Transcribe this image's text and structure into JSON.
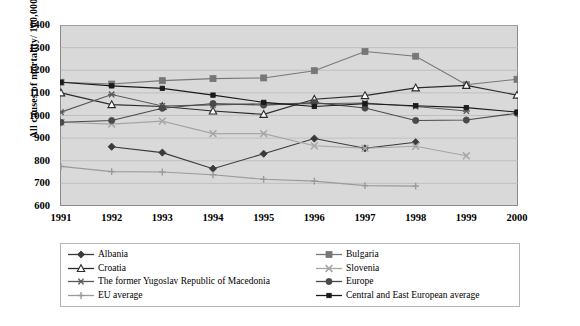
{
  "chart_data": {
    "type": "line",
    "title": "",
    "xlabel": "",
    "ylabel": "All causes of mortality/ 100,000",
    "x": [
      1991,
      1992,
      1993,
      1994,
      1995,
      1996,
      1997,
      1998,
      1999,
      2000
    ],
    "xticklabels": [
      "1991",
      "1992",
      "1993",
      "1994",
      "1995",
      "1996",
      "1997",
      "1998",
      "1999",
      "2000"
    ],
    "yticks": [
      600,
      700,
      800,
      900,
      1000,
      1100,
      1200,
      1300,
      1400
    ],
    "ylim": [
      600,
      1400
    ],
    "xlim": [
      1991,
      2000
    ],
    "grid": true,
    "grid_axis": "y",
    "plot_background": "#d9d9d9",
    "legend_position": "bottom",
    "series": [
      {
        "name": "Albania",
        "marker": "diamond",
        "color": "#3a3a3a",
        "x": [
          1992,
          1993,
          1994,
          1995,
          1996,
          1997,
          1998,
          1999
        ],
        "values": [
          862,
          836,
          765,
          831,
          898,
          855,
          882,
          null
        ]
      },
      {
        "name": "Bulgaria",
        "marker": "square",
        "color": "#777777",
        "x": [
          1991,
          1992,
          1993,
          1994,
          1995,
          1996,
          1997,
          1998,
          1999,
          2000
        ],
        "values": [
          1147,
          1139,
          1154,
          1163,
          1166,
          1198,
          1283,
          1262,
          1136,
          1160
        ]
      },
      {
        "name": "Croatia",
        "marker": "triangle-open",
        "color": "#2b2b2b",
        "x": [
          1991,
          1992,
          1993,
          1994,
          1995,
          1996,
          1997,
          1998,
          1999,
          2000
        ],
        "values": [
          1100,
          1048,
          1040,
          1020,
          1005,
          1072,
          1088,
          1122,
          1133,
          1090
        ]
      },
      {
        "name": "Slovenia",
        "marker": "x",
        "color": "#a6a6a6",
        "x": [
          1991,
          1992,
          1993,
          1994,
          1995,
          1996,
          1997,
          1998,
          1999,
          2000
        ],
        "values": [
          970,
          962,
          975,
          920,
          920,
          866,
          855,
          864,
          822,
          null
        ]
      },
      {
        "name": "The former Yugoslav Republic of Macedonia",
        "marker": "asterisk",
        "color": "#5a5a5a",
        "x": [
          1991,
          1992,
          1993,
          1994,
          1995,
          1996,
          1997,
          1998,
          1999,
          2000
        ],
        "values": [
          1015,
          1093,
          1042,
          1047,
          1052,
          1052,
          1055,
          1040,
          1020,
          null
        ]
      },
      {
        "name": "Europe",
        "marker": "circle",
        "color": "#4a4a4a",
        "x": [
          1991,
          1992,
          1993,
          1994,
          1995,
          1996,
          1997,
          1998,
          1999,
          2000
        ],
        "values": [
          970,
          978,
          1032,
          1053,
          1046,
          1057,
          1033,
          978,
          980,
          1010
        ]
      },
      {
        "name": "EU average",
        "marker": "plus",
        "color": "#9a9a9a",
        "x": [
          1991,
          1992,
          1993,
          1994,
          1995,
          1996,
          1997,
          1998
        ],
        "values": [
          775,
          752,
          750,
          738,
          718,
          710,
          690,
          688
        ]
      },
      {
        "name": "Central and East European average",
        "marker": "small-square",
        "color": "#1a1a1a",
        "x": [
          1991,
          1992,
          1993,
          1994,
          1995,
          1996,
          1997,
          1998,
          1999,
          2000
        ],
        "values": [
          1147,
          1131,
          1120,
          1090,
          1058,
          1040,
          1052,
          1043,
          1035,
          1015
        ]
      }
    ]
  },
  "legend": {
    "entries": [
      {
        "label": "Albania"
      },
      {
        "label": "Bulgaria"
      },
      {
        "label": "Croatia"
      },
      {
        "label": "Slovenia"
      },
      {
        "label": "The former Yugoslav Republic of Macedonia"
      },
      {
        "label": "Europe"
      },
      {
        "label": "EU average"
      },
      {
        "label": "Central and East European average"
      }
    ]
  }
}
